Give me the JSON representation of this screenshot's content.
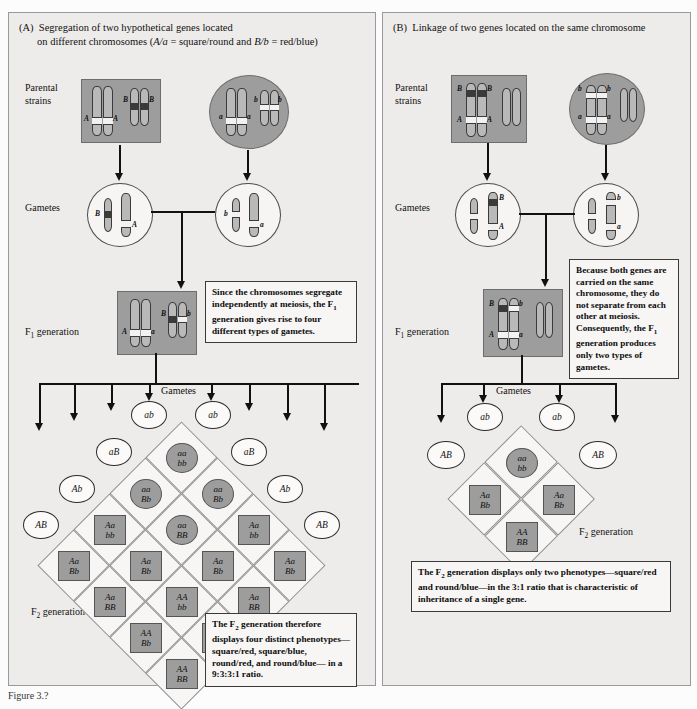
{
  "figure": {
    "caption": "Figure 3.?"
  },
  "panelA": {
    "tag": "(A)",
    "title_line1": "Segregation of two hypothetical genes located",
    "title_line2_pre": "on different chromosomes (",
    "title_line2_gene1": "A/a",
    "title_line2_mid": " = square/round and ",
    "title_line2_gene2": "B/b",
    "title_line2_post": " = red/blue)",
    "labels": {
      "parental": "Parental strains",
      "gametes": "Gametes",
      "f1": "F1 generation",
      "f2": "F2 generation",
      "gametes_center": "Gametes"
    },
    "parent_left": {
      "alleles": [
        "A",
        "A",
        "B",
        "B"
      ]
    },
    "parent_right": {
      "alleles": [
        "a",
        "a",
        "b",
        "b"
      ]
    },
    "gamete_left": {
      "alleles": [
        "B",
        "A"
      ]
    },
    "gamete_right": {
      "alleles": [
        "b",
        "a"
      ]
    },
    "f1": {
      "alleles": [
        "A",
        "a",
        "B",
        "b"
      ]
    },
    "note_f1": "Since the chromosomes segregate independently at meiosis, the F1 generation gives rise to four different types of gametes.",
    "note_f2": "The F2 generation therefore displays four distinct phenotypes— square/red, square/blue, round/red, and round/blue— in a 9:3:3:1 ratio.",
    "gametes_top": [
      "ab",
      "ab"
    ],
    "gametes_inner_upper": [
      "aB",
      "aB"
    ],
    "gametes_mid": [
      "Ab",
      "Ab"
    ],
    "gametes_outer": [
      "AB",
      "AB"
    ],
    "punnett": {
      "type": "4x4-diamond",
      "rows": [
        [
          {
            "top": "aa",
            "bottom": "bb",
            "shape": "round"
          }
        ],
        [
          {
            "top": "aa",
            "bottom": "Bb",
            "shape": "round"
          },
          {
            "top": "aa",
            "bottom": "Bb",
            "shape": "round"
          }
        ],
        [
          {
            "top": "Aa",
            "bottom": "bb",
            "shape": "square"
          },
          {
            "top": "aa",
            "bottom": "BB",
            "shape": "round"
          },
          {
            "top": "Aa",
            "bottom": "bb",
            "shape": "square"
          }
        ],
        [
          {
            "top": "Aa",
            "bottom": "Bb",
            "shape": "square"
          },
          {
            "top": "Aa",
            "bottom": "Bb",
            "shape": "square"
          },
          {
            "top": "Aa",
            "bottom": "Bb",
            "shape": "square"
          },
          {
            "top": "Aa",
            "bottom": "Bb",
            "shape": "square"
          }
        ],
        [
          {
            "top": "Aa",
            "bottom": "BB",
            "shape": "square"
          },
          {
            "top": "AA",
            "bottom": "bb",
            "shape": "square"
          },
          {
            "top": "Aa",
            "bottom": "BB",
            "shape": "square"
          }
        ],
        [
          {
            "top": "AA",
            "bottom": "Bb",
            "shape": "square"
          },
          {
            "top": "AA",
            "bottom": "Bb",
            "shape": "square"
          }
        ],
        [
          {
            "top": "AA",
            "bottom": "BB",
            "shape": "square"
          }
        ]
      ]
    }
  },
  "panelB": {
    "tag": "(B)",
    "title_line1": "Linkage of two genes located on the same chromosome",
    "labels": {
      "parental": "Parental strains",
      "gametes": "Gametes",
      "f1": "F1 generation",
      "f2": "F2 generation",
      "gametes_center": "Gametes"
    },
    "parent_left": {
      "alleles": [
        "B",
        "B",
        "A",
        "A"
      ]
    },
    "parent_right": {
      "alleles": [
        "b",
        "b",
        "a",
        "a"
      ]
    },
    "gamete_left": {
      "alleles": [
        "B",
        "A"
      ]
    },
    "gamete_right": {
      "alleles": [
        "b",
        "a"
      ]
    },
    "f1": {
      "alleles": [
        "B",
        "b",
        "A",
        "a"
      ]
    },
    "note_f1": "Because both genes are carried on the same chromosome, they do not separate from each other at meiosis. Consequently, the F1 generation produces only two types of gametes.",
    "note_f2": "The F2 generation displays only two phenotypes—square/red and round/blue—in the 3:1 ratio that is characteristic of inheritance of a single gene.",
    "gametes_top": [
      "ab",
      "ab"
    ],
    "gametes_outer": [
      "AB",
      "AB"
    ],
    "punnett": {
      "type": "2x2-diamond",
      "rows": [
        [
          {
            "top": "aa",
            "bottom": "bb",
            "shape": "round"
          }
        ],
        [
          {
            "top": "Aa",
            "bottom": "Bb",
            "shape": "square"
          },
          {
            "top": "Aa",
            "bottom": "Bb",
            "shape": "square"
          }
        ],
        [
          {
            "top": "AA",
            "bottom": "BB",
            "shape": "square"
          }
        ]
      ]
    }
  },
  "colors": {
    "panel_bg": "#eeecea",
    "parent_fill": "#9d9d9d",
    "gamete_fill": "#fbfaf8",
    "chromosome": "#b9b9b9",
    "ink": "#111111"
  }
}
